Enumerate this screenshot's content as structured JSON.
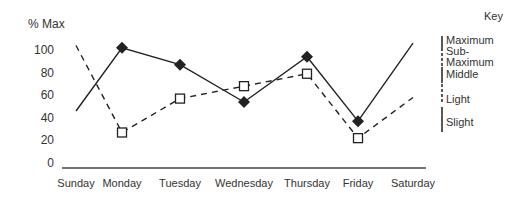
{
  "chart_data": {
    "type": "line",
    "title": "",
    "ylabel": "% Max",
    "xlabel": "",
    "ylim": [
      0,
      100
    ],
    "yticks": [
      0,
      20,
      40,
      60,
      80,
      100
    ],
    "categories": [
      "Sunday",
      "Monday",
      "Tuesday",
      "Wednesday",
      "Thursday",
      "Friday",
      "Saturday"
    ],
    "series": [
      {
        "name": "solid",
        "style": "solid",
        "marker": "filled-diamond",
        "markers_on": [
          1,
          2,
          3,
          4,
          5
        ],
        "values": [
          46,
          102,
          87,
          54,
          94,
          37,
          106
        ]
      },
      {
        "name": "dashed",
        "style": "dashed",
        "marker": "open-square",
        "markers_on": [
          1,
          2,
          3,
          4,
          5
        ],
        "values": [
          104,
          27,
          57,
          68,
          79,
          22,
          58
        ]
      }
    ],
    "grid": false,
    "legend": {
      "title": "Key",
      "placement": "right",
      "entries": [
        {
          "label": "Maximum",
          "style": "solid"
        },
        {
          "label": "Sub-",
          "style": "dashed"
        },
        {
          "label": "Maximum",
          "style": "dashed"
        },
        {
          "label": "Middle",
          "style": "solid"
        },
        {
          "label": "Light",
          "style": "dashed"
        },
        {
          "label": "Slight",
          "style": "solid"
        }
      ]
    },
    "colors": {
      "line": "#222222",
      "axis": "#444444"
    }
  }
}
